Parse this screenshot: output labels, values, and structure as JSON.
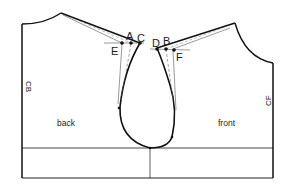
{
  "diagram": {
    "panels": {
      "back": {
        "label": "back"
      },
      "front": {
        "label": "front"
      }
    },
    "edges": {
      "center_back": "CB",
      "center_front": "CF"
    },
    "points": {
      "A": "A",
      "B": "B",
      "C": "C",
      "D": "D",
      "E": "E",
      "F": "F"
    },
    "colors": {
      "line": "#111111",
      "guide": "#555555",
      "background": "#ffffff"
    }
  }
}
